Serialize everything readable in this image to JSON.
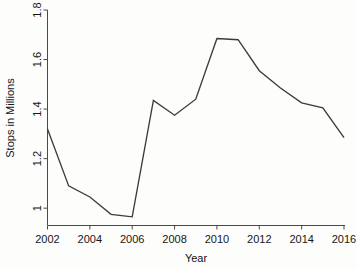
{
  "chart_data": {
    "type": "line",
    "title": "",
    "xlabel": "Year",
    "ylabel": "Stops in Millions",
    "x": [
      2002,
      2003,
      2004,
      2005,
      2006,
      2007,
      2008,
      2009,
      2010,
      2011,
      2012,
      2013,
      2014,
      2015,
      2016
    ],
    "values": [
      1.32,
      1.09,
      1.045,
      0.975,
      0.965,
      1.435,
      1.375,
      1.44,
      1.685,
      1.68,
      1.555,
      1.485,
      1.425,
      1.405,
      1.285
    ],
    "series": [
      {
        "name": "Stops in Millions",
        "values": [
          1.32,
          1.09,
          1.045,
          0.975,
          0.965,
          1.435,
          1.375,
          1.44,
          1.685,
          1.68,
          1.555,
          1.485,
          1.425,
          1.405,
          1.285
        ]
      }
    ],
    "xlim": [
      2002,
      2016
    ],
    "ylim": [
      0.93,
      1.8
    ],
    "xticks": [
      2002,
      2004,
      2006,
      2008,
      2010,
      2012,
      2014,
      2016
    ],
    "xtick_labels": [
      "2002",
      "2004",
      "2006",
      "2008",
      "2010",
      "2012",
      "2014",
      "2016"
    ],
    "yticks": [
      1.0,
      1.2,
      1.4,
      1.6,
      1.8
    ],
    "ytick_labels": [
      "1",
      "1.2",
      "1.4",
      "1.6",
      "1.8"
    ],
    "grid": false,
    "legend": "none",
    "line_color": "#3b3b3b",
    "axis_color": "#4a4a4a",
    "background_color": "#fdfdfc"
  },
  "axes": {
    "x_title": "Year",
    "y_title": "Stops in Millions"
  },
  "ticks": {
    "x": [
      {
        "label": "2002"
      },
      {
        "label": "2004"
      },
      {
        "label": "2006"
      },
      {
        "label": "2008"
      },
      {
        "label": "2010"
      },
      {
        "label": "2012"
      },
      {
        "label": "2014"
      },
      {
        "label": "2016"
      }
    ],
    "y": [
      {
        "label": "1"
      },
      {
        "label": "1.2"
      },
      {
        "label": "1.4"
      },
      {
        "label": "1.6"
      },
      {
        "label": "1.8"
      }
    ]
  }
}
